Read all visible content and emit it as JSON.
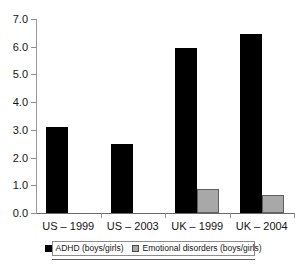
{
  "chart_data": {
    "type": "bar",
    "title": "",
    "subtitle": "",
    "xlabel": "",
    "ylabel": "",
    "ylim": [
      0.0,
      7.0
    ],
    "ytick_step": 1.0,
    "ytick_labels": [
      "0.0",
      "1.0",
      "2.0",
      "3.0",
      "4.0",
      "5.0",
      "6.0",
      "7.0"
    ],
    "ytick_values": [
      0.0,
      1.0,
      2.0,
      3.0,
      4.0,
      5.0,
      6.0,
      7.0
    ],
    "grid": false,
    "legend_position": "bottom",
    "categories": [
      "US – 1999",
      "US – 2003",
      "UK – 1999",
      "UK – 2004"
    ],
    "series": [
      {
        "name": "ADHD (boys/girls)",
        "color": "#000000",
        "values": [
          3.1,
          2.5,
          5.95,
          6.45
        ]
      },
      {
        "name": "Emotional disorders (boys/girls)",
        "color": "#a8a8a8",
        "values": [
          null,
          null,
          0.87,
          0.65
        ]
      }
    ]
  },
  "legend": {
    "entries": [
      {
        "label": "ADHD (boys/girls)",
        "swatch": "black-square-icon"
      },
      {
        "label": "Emotional disorders (boys/girls)",
        "swatch": "grey-square-icon"
      }
    ]
  }
}
